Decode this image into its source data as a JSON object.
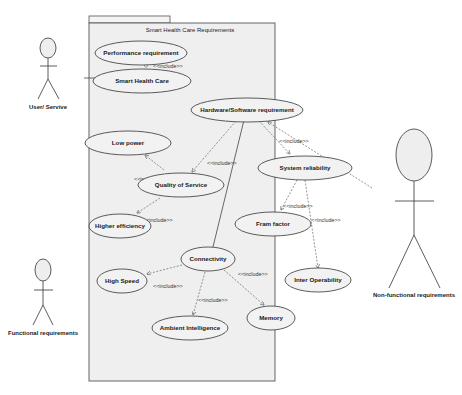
{
  "diagram": {
    "type": "UML use case diagram",
    "system_boundary": {
      "title": "Smart Health Care Requirements"
    },
    "actors": [
      {
        "id": "user",
        "label": "User/ Servive"
      },
      {
        "id": "functional",
        "label": "Functional requirements"
      },
      {
        "id": "nonfunctional",
        "label": "Non-functional requirements"
      }
    ],
    "use_cases": [
      {
        "id": "performance",
        "label": "Performance requirement"
      },
      {
        "id": "smart_health_care",
        "label": "Smart Health Care"
      },
      {
        "id": "hw_sw",
        "label": "Hardware/Software requirement"
      },
      {
        "id": "low_power",
        "label": "Low power"
      },
      {
        "id": "qos",
        "label": "Quality of Service"
      },
      {
        "id": "system_reliability",
        "label": "System reliability"
      },
      {
        "id": "higher_efficiency",
        "label": "Higher efficiency"
      },
      {
        "id": "from_factor",
        "label": "Fram factor"
      },
      {
        "id": "connectivity",
        "label": "Connectivity"
      },
      {
        "id": "high_speed",
        "label": "High Speed"
      },
      {
        "id": "inter_operability",
        "label": "Inter Operability"
      },
      {
        "id": "memory",
        "label": "Memory"
      },
      {
        "id": "ambient_intelligence",
        "label": "Ambient Intelligence"
      }
    ],
    "relationships": [
      {
        "from": "smart_health_care",
        "to": "performance",
        "type": "include",
        "label": "<<include>>"
      },
      {
        "from": "hw_sw",
        "to": "qos",
        "type": "include",
        "label": "<<include>>"
      },
      {
        "from": "hw_sw",
        "to": "system_reliability",
        "type": "include",
        "label": "<<include>>"
      },
      {
        "from": "qos",
        "to": "low_power",
        "type": "include",
        "label": "<<include>>"
      },
      {
        "from": "qos",
        "to": "higher_efficiency",
        "type": "include",
        "label": "<<include>>"
      },
      {
        "from": "system_reliability",
        "to": "from_factor",
        "type": "include",
        "label": "<<include>>"
      },
      {
        "from": "system_reliability",
        "to": "inter_operability",
        "type": "include",
        "label": "<<include>>"
      },
      {
        "from": "connectivity",
        "to": "high_speed",
        "type": "include",
        "label": "<<include>>"
      },
      {
        "from": "connectivity",
        "to": "ambient_intelligence",
        "type": "include",
        "label": "<<include>>"
      },
      {
        "from": "connectivity",
        "to": "memory",
        "type": "include",
        "label": "<<include>>"
      },
      {
        "from": "hw_sw",
        "to": "connectivity",
        "type": "association",
        "label": ""
      },
      {
        "from": "user",
        "to": "smart_health_care",
        "type": "association",
        "label": ""
      },
      {
        "from": "nonfunctional",
        "to": "hw_sw",
        "type": "dependency",
        "label": ""
      }
    ],
    "include_label": "<<include>>"
  }
}
